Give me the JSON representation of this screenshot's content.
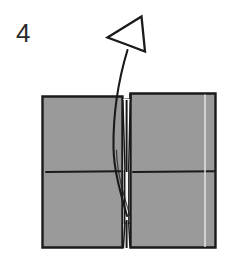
{
  "figure": {
    "kind": "origami-step-diagram",
    "step_number": "4"
  },
  "colors": {
    "background": "#ffffff",
    "paper_fill": "#9a9a9a",
    "paper_fill_light": "#a6a6a6",
    "outline": "#1a1a1a",
    "crease_line": "#1a1a1a",
    "highlight_line": "#e8e8e8",
    "slit_white": "#f2f2f2",
    "number_color": "#2b2b2b"
  },
  "elements": {
    "step_label": {
      "name": "step-number",
      "text": "4",
      "x": 16,
      "y": 20,
      "font_size": 26
    },
    "arrow": {
      "name": "fold-arrow",
      "style": "hollow-outline-curved",
      "head_tip": [
        108,
        36
      ],
      "head_points": "108,36 140,17 144,50 126,43",
      "stem_path": "M 126 48 C 118 76 112 110 114 150 C 115 175 121 196 126 216",
      "direction": "up-left"
    },
    "paper": {
      "name": "folded-paper",
      "left_panel": {
        "name": "left-panel",
        "x": 42,
        "y": 96,
        "width": 81,
        "height": 152,
        "crease": {
          "name": "left-crease-line",
          "x1": 46,
          "y1": 172,
          "x2": 120,
          "y2": 171
        }
      },
      "right_panel": {
        "name": "right-panel",
        "x": 130,
        "y": 93,
        "width": 86,
        "height": 155,
        "crease": {
          "name": "right-crease-line",
          "x1": 133,
          "y1": 172,
          "x2": 215,
          "y2": 171
        },
        "highlight": {
          "name": "right-highlight-line",
          "x": 205,
          "y1": 93,
          "y2": 248
        }
      },
      "center_slit": {
        "name": "center-slit",
        "x": 123,
        "y": 93,
        "width": 7,
        "height": 155,
        "notch_depth": 6
      }
    }
  }
}
